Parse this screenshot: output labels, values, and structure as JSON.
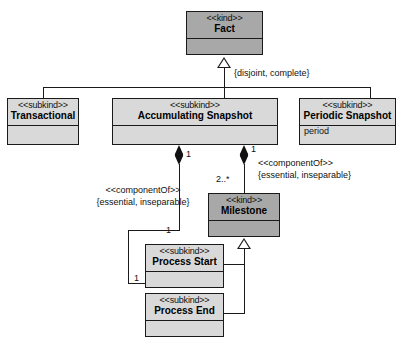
{
  "diagram": {
    "colors": {
      "kind_fill": "#a8a8a8",
      "subkind_fill": "#d9d9d9",
      "line": "#1a1a1a",
      "background": "#ffffff"
    }
  },
  "classes": {
    "fact": {
      "stereotype": "<<kind>>",
      "name": "Fact",
      "attributes": ""
    },
    "transactional": {
      "stereotype": "<<subkind>>",
      "name": "Transactional",
      "attributes": ""
    },
    "accumulating_snapshot": {
      "stereotype": "<<subkind>>",
      "name": "Accumulating Snapshot",
      "attributes": ""
    },
    "periodic_snapshot": {
      "stereotype": "<<subkind>>",
      "name": "Periodic Snapshot",
      "attributes": "period"
    },
    "milestone": {
      "stereotype": "<<kind>>",
      "name": "Milestone",
      "attributes": ""
    },
    "process_start": {
      "stereotype": "<<subkind>>",
      "name": "Process Start",
      "attributes": ""
    },
    "process_end": {
      "stereotype": "<<subkind>>",
      "name": "Process End",
      "attributes": ""
    }
  },
  "labels": {
    "generalization_fact": "{disjoint, complete}",
    "component_of_left_stereotype": "<<componentOf>>",
    "component_of_left_constraint": "{essential, inseparable}",
    "component_of_right_stereotype": "<<componentOf>>",
    "component_of_right_constraint": "{essential, inseparable}"
  },
  "multiplicities": {
    "snapshot_to_start_source": "1",
    "snapshot_to_milestone_source": "1",
    "milestone_target": "2..*",
    "process_start_end": "1",
    "process_end_end": "1"
  }
}
